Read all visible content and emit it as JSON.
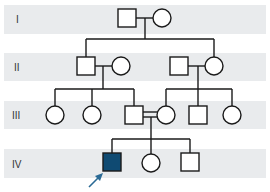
{
  "colors": {
    "band": "#e9ebed",
    "line": "#1a1a1a",
    "affected": "#0f4a72",
    "proband_arrow": "#2a6a95"
  },
  "generations": [
    {
      "label": "I",
      "band": {
        "y": 5,
        "h": 29
      }
    },
    {
      "label": "II",
      "band": {
        "y": 53,
        "h": 28
      }
    },
    {
      "label": "III",
      "band": {
        "y": 101,
        "h": 28
      }
    },
    {
      "label": "IV",
      "band": {
        "y": 149,
        "h": 29
      }
    }
  ],
  "individuals": [
    {
      "id": "I-1",
      "generation": "I",
      "sex": "male",
      "affected": false
    },
    {
      "id": "I-2",
      "generation": "I",
      "sex": "female",
      "affected": false
    },
    {
      "id": "II-1",
      "generation": "II",
      "sex": "male",
      "affected": false
    },
    {
      "id": "II-2",
      "generation": "II",
      "sex": "female",
      "affected": false
    },
    {
      "id": "II-3",
      "generation": "II",
      "sex": "male",
      "affected": false
    },
    {
      "id": "II-4",
      "generation": "II",
      "sex": "female",
      "affected": false
    },
    {
      "id": "III-1",
      "generation": "III",
      "sex": "female",
      "affected": false
    },
    {
      "id": "III-2",
      "generation": "III",
      "sex": "female",
      "affected": false
    },
    {
      "id": "III-3",
      "generation": "III",
      "sex": "male",
      "affected": false
    },
    {
      "id": "III-4",
      "generation": "III",
      "sex": "female",
      "affected": false
    },
    {
      "id": "III-5",
      "generation": "III",
      "sex": "male",
      "affected": false
    },
    {
      "id": "III-6",
      "generation": "III",
      "sex": "female",
      "affected": false
    },
    {
      "id": "IV-1",
      "generation": "IV",
      "sex": "male",
      "affected": true,
      "proband": true
    },
    {
      "id": "IV-2",
      "generation": "IV",
      "sex": "female",
      "affected": false
    },
    {
      "id": "IV-3",
      "generation": "IV",
      "sex": "male",
      "affected": false
    }
  ],
  "unions": [
    {
      "partners": [
        "I-1",
        "I-2"
      ],
      "consanguineous": false,
      "children": [
        "II-1",
        "II-4"
      ]
    },
    {
      "partners": [
        "II-1",
        "II-2"
      ],
      "consanguineous": false,
      "children": [
        "III-1",
        "III-2",
        "III-3"
      ]
    },
    {
      "partners": [
        "II-3",
        "II-4"
      ],
      "consanguineous": false,
      "children": [
        "III-4",
        "III-5",
        "III-6"
      ]
    },
    {
      "partners": [
        "III-3",
        "III-4"
      ],
      "consanguineous": true,
      "children": [
        "IV-1",
        "IV-2",
        "IV-3"
      ]
    }
  ],
  "legend": {
    "proband_marker": "arrow"
  }
}
